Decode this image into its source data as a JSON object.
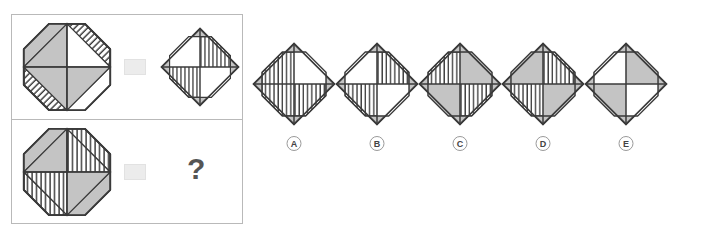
{
  "puzzle": {
    "type": "visual-analogy-matrix",
    "colors": {
      "stroke": "#3a3a3a",
      "fill_gray": "#c4c4c4",
      "fill_white": "#ffffff",
      "hatch": "#3a3a3a",
      "panel_border": "#b9b9b9",
      "op_box": "#ececec",
      "label_text": "#444444",
      "question_mark": "#555555"
    },
    "question_mark": "?",
    "operator_symbol": "op-box",
    "rows": [
      {
        "name": "example-row",
        "source": {
          "outer": "octagon",
          "inner": "diamond-quartered",
          "quadrants": [
            "gray",
            "white",
            "gray",
            "gray"
          ],
          "corners": [
            "gray",
            "hatched",
            "hatched",
            "white"
          ]
        },
        "result": {
          "outer": "diamond",
          "inner": "octagon-quartered",
          "quadrants": [
            "white",
            "hatched",
            "hatched",
            "white"
          ],
          "corners": [
            "gray",
            "gray",
            "gray",
            "gray"
          ]
        }
      },
      {
        "name": "question-row",
        "source": {
          "outer": "octagon",
          "inner": "diamond-quartered",
          "quadrants": [
            "gray",
            "hatched",
            "hatched",
            "gray"
          ],
          "corners": [
            "gray",
            "hatched",
            "hatched",
            "gray"
          ]
        },
        "result": "?"
      }
    ],
    "options": [
      {
        "label": "A",
        "outer": "diamond",
        "inner": "octagon-quartered",
        "quadrants": [
          "hatched",
          "white",
          "hatched",
          "hatched"
        ],
        "corners": [
          "gray",
          "gray",
          "gray",
          "gray"
        ]
      },
      {
        "label": "B",
        "outer": "diamond",
        "inner": "octagon-quartered",
        "quadrants": [
          "white",
          "hatched",
          "hatched",
          "white"
        ],
        "corners": [
          "gray",
          "gray",
          "gray",
          "gray"
        ]
      },
      {
        "label": "C",
        "outer": "diamond",
        "inner": "octagon-quartered",
        "quadrants": [
          "hatched",
          "gray",
          "gray",
          "hatched"
        ],
        "corners": [
          "gray",
          "gray",
          "gray",
          "gray"
        ]
      },
      {
        "label": "D",
        "outer": "diamond",
        "inner": "octagon-quartered",
        "quadrants": [
          "gray",
          "hatched",
          "hatched",
          "gray"
        ],
        "corners": [
          "gray",
          "gray",
          "gray",
          "gray"
        ]
      },
      {
        "label": "E",
        "outer": "diamond",
        "inner": "octagon-quartered",
        "quadrants": [
          "white",
          "gray",
          "gray",
          "white"
        ],
        "corners": [
          "gray",
          "gray",
          "gray",
          "gray"
        ]
      }
    ]
  }
}
